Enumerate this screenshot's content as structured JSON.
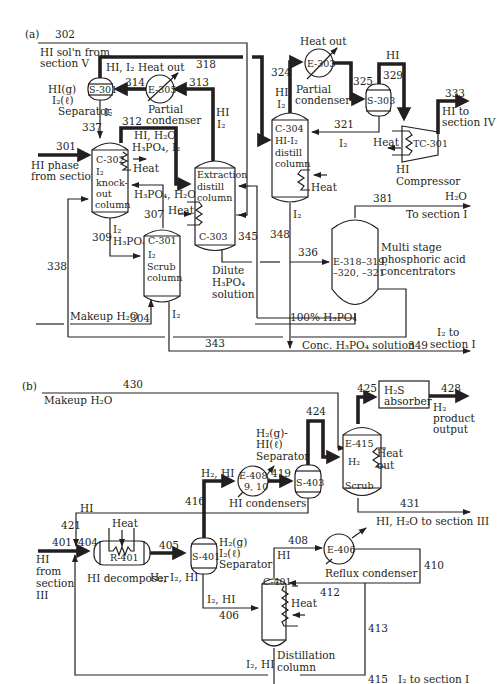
{
  "panels": {
    "a": {
      "label": "(a)",
      "streams": {
        "s301": "301",
        "s302": "302",
        "s304": "304",
        "s307": "307",
        "s309": "309",
        "s312": "312",
        "s313": "313",
        "s314": "314",
        "s318": "318",
        "s321": "321",
        "s324": "324",
        "s325": "325",
        "s329": "329",
        "s333": "333",
        "s336": "336",
        "s337": "337",
        "s338": "338",
        "s343": "343",
        "s345": "345",
        "s348": "348",
        "s349": "349",
        "s381": "381"
      },
      "equipment": {
        "s301": {
          "id": "S-301",
          "desc1": "HI(g)",
          "desc2": "I₂(ℓ)",
          "desc3": "Separator"
        },
        "e305": {
          "id": "E-305",
          "desc1": "Partial",
          "desc2": "condenser",
          "heat": "Heat out"
        },
        "c302": {
          "id": "C-302",
          "desc1": "I₂",
          "desc2": "knock-",
          "desc3": "out",
          "desc4": "column",
          "heat": "Heat"
        },
        "c303": {
          "id": "C-303",
          "desc1": "Extraction",
          "desc2": "distill",
          "desc3": "column",
          "heat": "Heat"
        },
        "c301": {
          "id": "C-301",
          "desc1": "I₂",
          "desc2": "Scrub",
          "desc3": "column"
        },
        "e303": {
          "id": "E-303",
          "desc1": "Partial",
          "desc2": "condenser",
          "heat": "Heat out"
        },
        "s303": {
          "id": "S-303"
        },
        "c304": {
          "id": "C-304",
          "desc1": "HI-I₂",
          "desc2": "distill",
          "desc3": "column",
          "heat": "Heat"
        },
        "tc301": {
          "id": "TC-301",
          "desc1": "HI",
          "desc2": "Compressor",
          "heat": "Heat"
        },
        "e318": {
          "id1": "E-318–319,",
          "id2": "–320, –321",
          "desc1": "Multi stage",
          "desc2": "phosphoric acid",
          "desc3": "concentrators"
        }
      },
      "labels": {
        "hi_soln_1": "HI sol'n from",
        "hi_soln_2": "section V",
        "hi_i2_top": "HI, I₂",
        "i2_s301": "I₂",
        "hi_e305": "HI",
        "i2_e305": "I₂",
        "mix_312_1": "HI, H₂O,",
        "mix_312_2": "H₃PO₄, I₂",
        "hi_phase_1": "HI phase",
        "hi_phase_2": "from section I",
        "h3po4_h2o": "H₃PO₄, H₂O",
        "i2_309": "I₂",
        "h3po4_309": "H₃PO₄",
        "dilute_1": "Dilute",
        "dilute_2": "H₃PO₄",
        "dilute_3": "solution",
        "makeup_h2o": "Makeup H₂O",
        "i2_c301": "I₂",
        "hi_324": "HI",
        "i2_324": "I₂",
        "hi_329": "HI",
        "i2_321": "I₂",
        "hi_to_1": "HI to",
        "hi_to_2": "section IV",
        "i2_348": "I₂",
        "h2o_381": "H₂O",
        "to_section_1": "To section I",
        "pct100": "100% H₃PO₄",
        "conc": "Conc. H₃PO₄ solution",
        "i2_to_1": "I₂ to",
        "i2_to_2": "section I"
      }
    },
    "b": {
      "label": "(b)",
      "streams": {
        "s401": "401",
        "s404": "404",
        "s405": "405",
        "s406": "406",
        "s408": "408",
        "s410": "410",
        "s412": "412",
        "s413": "413",
        "s415": "415",
        "s416": "416",
        "s419": "419",
        "s421": "421",
        "s424": "424",
        "s425": "425",
        "s428": "428",
        "s430": "430",
        "s431": "431"
      },
      "equipment": {
        "r401": {
          "id": "R-401",
          "desc": "HI decomposer",
          "heat": "Heat"
        },
        "s401": {
          "id": "S-401",
          "desc1": "H₂(g)",
          "desc2": "I₂(ℓ)",
          "desc3": "Separator"
        },
        "e408": {
          "id1": "E-408,",
          "id2": "9, 10",
          "desc": "HI condensers"
        },
        "s403": {
          "id": "S-403",
          "desc1": "H₂(g)-",
          "desc2": "HI(ℓ)",
          "desc3": "Separator"
        },
        "e415": {
          "id": "E-415",
          "desc1": "H₂",
          "desc2": "Scrub",
          "heat1": "Heat",
          "heat2": "out"
        },
        "h2s": {
          "desc1": "H₂S",
          "desc2": "absorber"
        },
        "e406": {
          "id": "E-406",
          "desc": "Reflux condenser"
        },
        "c401": {
          "id": "C-401",
          "desc1": "Distillation",
          "desc2": "column",
          "heat": "Heat"
        }
      },
      "labels": {
        "makeup_h2o": "Makeup H₂O",
        "h2_product_1": "H₂",
        "h2_product_2": "product",
        "h2_product_3": "output",
        "h2_hi": "H₂, HI",
        "hi_421": "HI",
        "hi_from_1": "HI",
        "hi_from_2": "from",
        "hi_from_3": "section",
        "hi_from_4": "III",
        "h2_i2_hi": "H₂, I₂, HI",
        "hi_h2o_to": "HI, H₂O to section III",
        "hi_408": "HI",
        "i2_hi_406": "I₂, HI",
        "i2_hi_bottom": "I₂, HI",
        "i2_to_section": "I₂ to section I"
      }
    }
  }
}
